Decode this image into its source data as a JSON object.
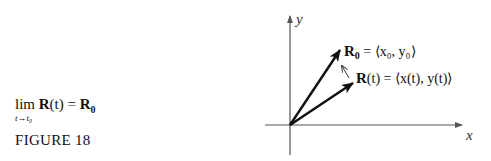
{
  "caption": {
    "limit_operator": "lim",
    "limit_subscript": "t→t₀",
    "limit_expression_func": "R",
    "limit_expression_arg": "(t)",
    "limit_equals": " = ",
    "limit_result": "R",
    "limit_result_sub": "0",
    "figure_label": "FIGURE 18"
  },
  "diagram": {
    "axis_x_label": "x",
    "axis_y_label": "y",
    "vector_R0_label_name": "R",
    "vector_R0_label_sub": "0",
    "vector_R0_label_rhs": " = ⟨x₀, y₀⟩",
    "vector_Rt_label_name": "R",
    "vector_Rt_label_arg": "(t)",
    "vector_Rt_label_rhs": " = ⟨x(t), y(t)⟩",
    "line_color": "#111111",
    "axis_color": "#555555"
  }
}
